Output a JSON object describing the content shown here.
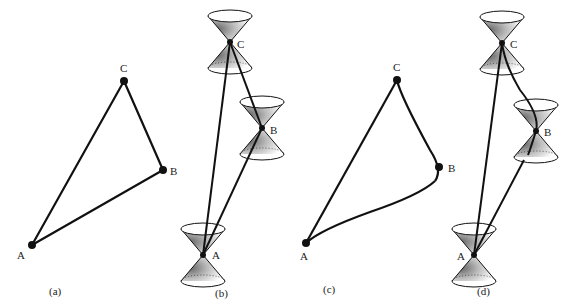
{
  "panels": [
    {
      "id": "a",
      "caption": "(a)",
      "points": {
        "A": "A",
        "B": "B",
        "C": "C"
      },
      "style": "straight triangle"
    },
    {
      "id": "b",
      "caption": "(b)",
      "points": {
        "A": "A",
        "B": "B",
        "C": "C"
      },
      "style": "straight worldlines with light cones"
    },
    {
      "id": "c",
      "caption": "(c)",
      "points": {
        "A": "A",
        "B": "B",
        "C": "C"
      },
      "style": "curved path triangle"
    },
    {
      "id": "d",
      "caption": "(d)",
      "points": {
        "A": "A",
        "B": "B",
        "C": "C"
      },
      "style": "curved worldlines with light cones"
    }
  ],
  "colors": {
    "ink": "#111111",
    "background": "#ffffff"
  }
}
